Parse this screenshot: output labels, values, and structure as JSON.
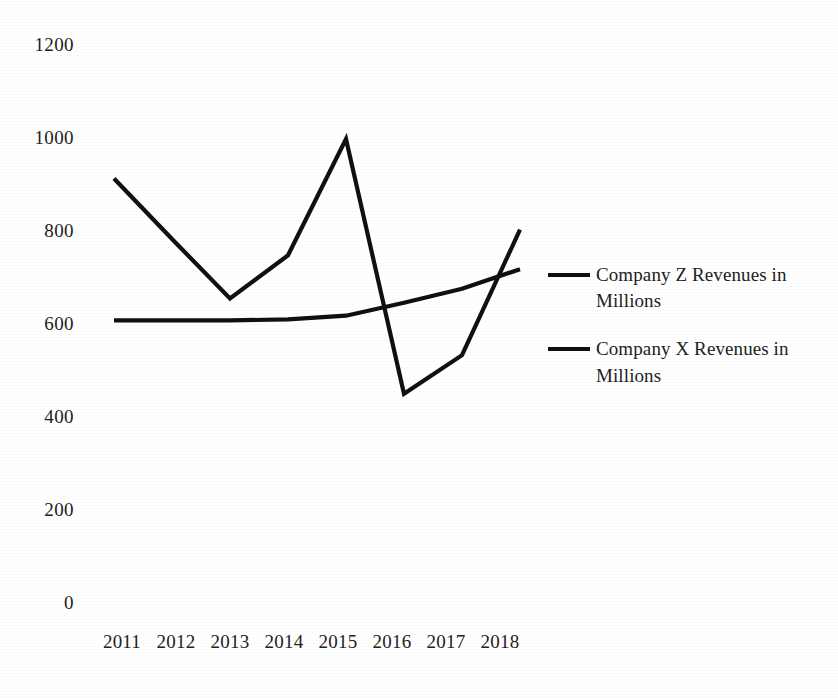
{
  "chart_data": {
    "type": "line",
    "title": "",
    "subtitle": "",
    "xlabel": "",
    "ylabel": "",
    "categories": [
      "2011",
      "2012",
      "2013",
      "2014",
      "2015",
      "2016",
      "2017",
      "2018"
    ],
    "xlim": [
      0,
      7
    ],
    "ylim": [
      0,
      1200
    ],
    "yticks": [
      0,
      200,
      400,
      600,
      800,
      1000,
      1200
    ],
    "ytick_labels": [
      "0",
      "200",
      "400",
      "600",
      "800",
      "1000",
      "1200"
    ],
    "grid": false,
    "legend_position": "right",
    "line_color": "#101010",
    "background_color": "#ffffff",
    "series": [
      {
        "name": "Company Z Revenues in Millions",
        "color": "#101010",
        "values": [
          610,
          610,
          610,
          612,
          620,
          648,
          678,
          720
        ]
      },
      {
        "name": "Company X Revenues in Millions",
        "color": "#101010",
        "values": [
          915,
          785,
          657,
          750,
          1000,
          452,
          535,
          805
        ]
      }
    ]
  },
  "legend": {
    "entries": [
      {
        "label_line1": "Company Z Revenues in",
        "label_line2": "Millions"
      },
      {
        "label_line1": "Company X Revenues in",
        "label_line2": "Millions"
      }
    ]
  }
}
